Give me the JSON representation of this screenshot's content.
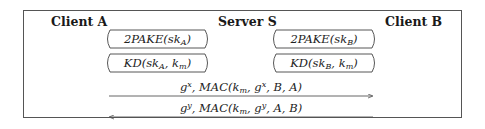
{
  "diagram": {
    "type": "protocol-sequence",
    "parties": {
      "client_a": "Client A",
      "server": "Server S",
      "client_b": "Client B"
    },
    "exchanges": [
      {
        "between": "Client A ↔ Server S",
        "label_main": "2PAKE(sk",
        "label_sub": "A",
        "label_tail": ")"
      },
      {
        "between": "Server S ↔ Client B",
        "label_main": "2PAKE(sk",
        "label_sub": "B",
        "label_tail": ")"
      },
      {
        "between": "Client A ↔ Server S",
        "label_main": "KD(sk",
        "label_sub": "A",
        "label_mid": ", k",
        "label_sub2": "m",
        "label_tail": ")"
      },
      {
        "between": "Server S ↔ Client B",
        "label_main": "KD(sk",
        "label_sub": "B",
        "label_mid": ", k",
        "label_sub2": "m",
        "label_tail": ")"
      }
    ],
    "messages": [
      {
        "direction": "A → B",
        "g": "g",
        "exp": "x",
        "mac_pre": ", MAC(k",
        "mac_sub": "m",
        "mac_g": ", g",
        "mac_exp": "x",
        "mac_tail": ", B, A)"
      },
      {
        "direction": "B → A",
        "g": "g",
        "exp": "y",
        "mac_pre": ", MAC(k",
        "mac_sub": "m",
        "mac_g": ", g",
        "mac_exp": "y",
        "mac_tail": ", A, B)"
      }
    ]
  }
}
